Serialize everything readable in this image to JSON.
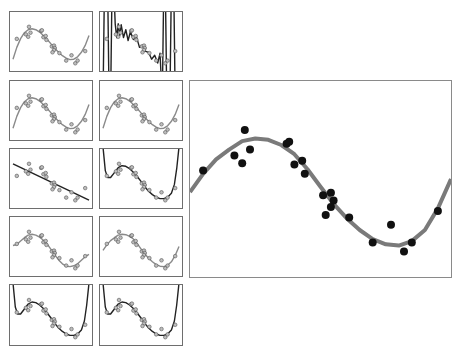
{
  "chart_data": {
    "type": "scatter",
    "title": "",
    "xlim": [
      0,
      1
    ],
    "ylim": [
      -1.5,
      1.5
    ],
    "grid": false,
    "axes_ticks": false,
    "points": {
      "x": [
        0.05,
        0.21,
        0.17,
        0.2,
        0.23,
        0.37,
        0.38,
        0.4,
        0.43,
        0.44,
        0.51,
        0.54,
        0.55,
        0.54,
        0.52,
        0.61,
        0.7,
        0.77,
        0.82,
        0.85,
        0.95
      ],
      "y": [
        0.13,
        0.75,
        0.36,
        0.24,
        0.45,
        0.54,
        0.57,
        0.22,
        0.28,
        0.08,
        -0.25,
        -0.21,
        -0.33,
        -0.43,
        -0.55,
        -0.59,
        -0.97,
        -0.7,
        -1.11,
        -0.97,
        -0.49
      ]
    },
    "panels": [
      {
        "id": "p1",
        "row": 0,
        "col": 0,
        "fit": "degree-3",
        "line_color": "#8a8a8a",
        "line_width": 1.4
      },
      {
        "id": "p2",
        "row": 0,
        "col": 1,
        "fit": "overfit-high-degree",
        "line_color": "#222222",
        "line_width": 1.4
      },
      {
        "id": "p3",
        "row": 1,
        "col": 0,
        "fit": "degree-3",
        "line_color": "#8a8a8a",
        "line_width": 1.4
      },
      {
        "id": "p4",
        "row": 1,
        "col": 1,
        "fit": "degree-3",
        "line_color": "#8a8a8a",
        "line_width": 1.4
      },
      {
        "id": "p5",
        "row": 2,
        "col": 0,
        "fit": "degree-1",
        "line_color": "#222222",
        "line_width": 1.4
      },
      {
        "id": "p6",
        "row": 2,
        "col": 1,
        "fit": "degree-high-edges",
        "line_color": "#222222",
        "line_width": 1.4
      },
      {
        "id": "p7",
        "row": 3,
        "col": 0,
        "fit": "degree-5",
        "line_color": "#8a8a8a",
        "line_width": 1.4
      },
      {
        "id": "p8",
        "row": 3,
        "col": 1,
        "fit": "degree-4",
        "line_color": "#8a8a8a",
        "line_width": 1.4
      },
      {
        "id": "p9",
        "row": 4,
        "col": 0,
        "fit": "degree-high-edges",
        "line_color": "#222222",
        "line_width": 1.4
      },
      {
        "id": "p10",
        "row": 4,
        "col": 1,
        "fit": "degree-high-edges",
        "line_color": "#222222",
        "line_width": 1.4
      },
      {
        "id": "big",
        "fit": "smooth-sine",
        "line_color": "#7a7a7a",
        "line_width": 4,
        "point_color": "#111111"
      }
    ],
    "curves": {
      "sine": [
        [
          0,
          -0.2
        ],
        [
          0.05,
          0.08
        ],
        [
          0.1,
          0.3
        ],
        [
          0.15,
          0.45
        ],
        [
          0.2,
          0.58
        ],
        [
          0.25,
          0.62
        ],
        [
          0.3,
          0.6
        ],
        [
          0.35,
          0.52
        ],
        [
          0.4,
          0.38
        ],
        [
          0.45,
          0.15
        ],
        [
          0.5,
          -0.12
        ],
        [
          0.55,
          -0.38
        ],
        [
          0.6,
          -0.6
        ],
        [
          0.65,
          -0.78
        ],
        [
          0.7,
          -0.92
        ],
        [
          0.75,
          -1.0
        ],
        [
          0.8,
          -1.02
        ],
        [
          0.85,
          -0.95
        ],
        [
          0.9,
          -0.78
        ],
        [
          0.95,
          -0.45
        ],
        [
          1.0,
          0.0
        ]
      ],
      "cubic": [
        [
          0,
          -0.9
        ],
        [
          0.05,
          -0.3
        ],
        [
          0.1,
          0.15
        ],
        [
          0.15,
          0.45
        ],
        [
          0.2,
          0.6
        ],
        [
          0.25,
          0.65
        ],
        [
          0.3,
          0.6
        ],
        [
          0.35,
          0.48
        ],
        [
          0.4,
          0.3
        ],
        [
          0.45,
          0.1
        ],
        [
          0.5,
          -0.12
        ],
        [
          0.55,
          -0.35
        ],
        [
          0.6,
          -0.55
        ],
        [
          0.65,
          -0.72
        ],
        [
          0.7,
          -0.85
        ],
        [
          0.75,
          -0.92
        ],
        [
          0.8,
          -0.9
        ],
        [
          0.85,
          -0.78
        ],
        [
          0.9,
          -0.55
        ],
        [
          0.95,
          -0.2
        ],
        [
          1.0,
          0.3
        ]
      ],
      "linear": [
        [
          0,
          0.75
        ],
        [
          1,
          -1.1
        ]
      ],
      "deg5": [
        [
          0,
          0.05
        ],
        [
          0.05,
          0.1
        ],
        [
          0.1,
          0.28
        ],
        [
          0.15,
          0.45
        ],
        [
          0.2,
          0.58
        ],
        [
          0.25,
          0.62
        ],
        [
          0.3,
          0.58
        ],
        [
          0.35,
          0.48
        ],
        [
          0.4,
          0.32
        ],
        [
          0.45,
          0.12
        ],
        [
          0.5,
          -0.15
        ],
        [
          0.55,
          -0.42
        ],
        [
          0.6,
          -0.68
        ],
        [
          0.65,
          -0.88
        ],
        [
          0.7,
          -1.0
        ],
        [
          0.75,
          -1.02
        ],
        [
          0.8,
          -0.98
        ],
        [
          0.85,
          -0.88
        ],
        [
          0.9,
          -0.7
        ],
        [
          0.95,
          -0.52
        ],
        [
          1.0,
          -0.4
        ]
      ],
      "edges": [
        [
          0,
          1.6
        ],
        [
          0.03,
          0.4
        ],
        [
          0.06,
          0.05
        ],
        [
          0.1,
          0.05
        ],
        [
          0.15,
          0.3
        ],
        [
          0.2,
          0.55
        ],
        [
          0.25,
          0.65
        ],
        [
          0.3,
          0.62
        ],
        [
          0.35,
          0.5
        ],
        [
          0.4,
          0.32
        ],
        [
          0.45,
          0.1
        ],
        [
          0.5,
          -0.15
        ],
        [
          0.55,
          -0.42
        ],
        [
          0.6,
          -0.65
        ],
        [
          0.65,
          -0.82
        ],
        [
          0.7,
          -0.95
        ],
        [
          0.75,
          -1.02
        ],
        [
          0.8,
          -1.02
        ],
        [
          0.85,
          -0.95
        ],
        [
          0.9,
          -0.75
        ],
        [
          0.94,
          -0.3
        ],
        [
          0.97,
          0.5
        ],
        [
          1.0,
          1.6
        ]
      ],
      "overfit": [
        [
          0,
          -3
        ],
        [
          0.02,
          3
        ],
        [
          0.06,
          3
        ],
        [
          0.08,
          -3
        ],
        [
          0.1,
          -3
        ],
        [
          0.12,
          3
        ],
        [
          0.14,
          3
        ],
        [
          0.16,
          0.9
        ],
        [
          0.18,
          0.2
        ],
        [
          0.2,
          0.9
        ],
        [
          0.22,
          0.3
        ],
        [
          0.24,
          0.85
        ],
        [
          0.27,
          0.2
        ],
        [
          0.3,
          0.6
        ],
        [
          0.33,
          0.05
        ],
        [
          0.36,
          0.5
        ],
        [
          0.4,
          0.1
        ],
        [
          0.44,
          0.25
        ],
        [
          0.48,
          -0.3
        ],
        [
          0.52,
          -0.2
        ],
        [
          0.56,
          -0.5
        ],
        [
          0.6,
          -0.55
        ],
        [
          0.64,
          -0.9
        ],
        [
          0.68,
          -0.7
        ],
        [
          0.72,
          -1.1
        ],
        [
          0.75,
          -0.6
        ],
        [
          0.78,
          -3
        ],
        [
          0.8,
          3
        ],
        [
          0.82,
          3
        ],
        [
          0.84,
          -3
        ],
        [
          0.88,
          -3
        ],
        [
          0.9,
          3
        ],
        [
          0.93,
          3
        ],
        [
          0.95,
          -3
        ]
      ]
    }
  }
}
